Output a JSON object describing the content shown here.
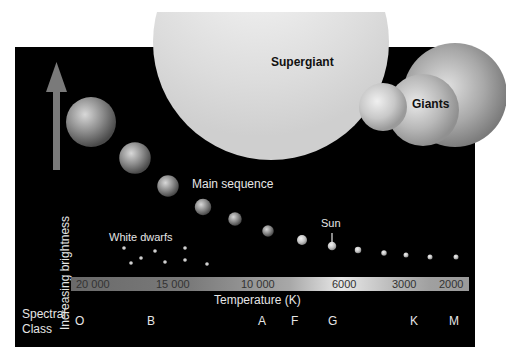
{
  "diagram": {
    "y_axis_label": "Increasing brightness",
    "x_axis_label": "Temperature (K)",
    "temperature_ticks": [
      "20 000",
      "15 000",
      "10 000",
      "6000",
      "3000",
      "2000"
    ],
    "spectral_class_label_line1": "Spectral",
    "spectral_class_label_line2": "Class",
    "spectral_classes": [
      "O",
      "B",
      "A",
      "F",
      "G",
      "K",
      "M"
    ],
    "groups": {
      "supergiant": "Supergiant",
      "giants": "Giants",
      "main_sequence": "Main sequence",
      "white_dwarfs": "White dwarfs",
      "sun": "Sun"
    },
    "colors": {
      "background": "#000000",
      "page": "#ffffff",
      "label": "#e6e6e6",
      "arrow": "#7a7a7a"
    },
    "main_sequence_stars": [
      {
        "spectral": "O",
        "relative_size": 1.0
      },
      {
        "spectral": "O-B",
        "relative_size": 0.63
      },
      {
        "spectral": "B",
        "relative_size": 0.43
      },
      {
        "spectral": "B-A",
        "relative_size": 0.33
      },
      {
        "spectral": "A",
        "relative_size": 0.27
      },
      {
        "spectral": "A-F",
        "relative_size": 0.23
      },
      {
        "spectral": "F",
        "relative_size": 0.2
      },
      {
        "spectral": "G",
        "relative_size": 0.17,
        "label": "Sun"
      },
      {
        "spectral": "G-K",
        "relative_size": 0.13
      },
      {
        "spectral": "K",
        "relative_size": 0.11
      },
      {
        "spectral": "K-M",
        "relative_size": 0.09
      },
      {
        "spectral": "M",
        "relative_size": 0.08
      },
      {
        "spectral": "M",
        "relative_size": 0.07
      }
    ]
  }
}
